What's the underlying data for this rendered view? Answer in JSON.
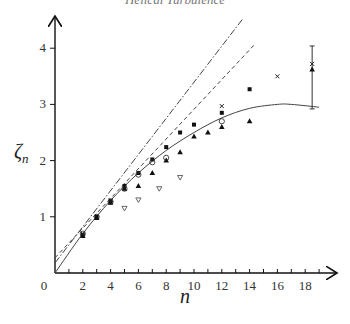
{
  "chart_data": {
    "type": "scatter",
    "title": "Helical Turbulence",
    "xlabel": "n",
    "ylabel": "ζ_n",
    "xlim": [
      0,
      19.5
    ],
    "ylim": [
      0,
      4.4
    ],
    "x_ticks": [
      2,
      4,
      6,
      8,
      10,
      12,
      14,
      16,
      18
    ],
    "y_ticks": [
      0,
      1,
      2,
      3,
      4
    ],
    "grid": false,
    "legend": null,
    "lines": [
      {
        "name": "dash-dot line (K41-like, slope ~0.4)",
        "style": "dash-dot",
        "x": [
          0,
          13.5
        ],
        "y": [
          0.18,
          4.52
        ]
      },
      {
        "name": "dashed line",
        "style": "dashed",
        "x": [
          0,
          14.3
        ],
        "y": [
          0.27,
          4.05
        ]
      },
      {
        "name": "solid model curve",
        "style": "solid",
        "x": [
          0,
          2,
          4,
          6,
          8,
          10,
          12,
          14,
          16,
          17,
          19
        ],
        "y": [
          0,
          0.7,
          1.29,
          1.78,
          2.18,
          2.5,
          2.76,
          2.93,
          3.0,
          3.0,
          2.95
        ]
      }
    ],
    "series": [
      {
        "name": "filled squares",
        "marker": "square-filled",
        "x": [
          2,
          3,
          4,
          5,
          6,
          7,
          8,
          9,
          10,
          12,
          14
        ],
        "y": [
          0.68,
          1.0,
          1.28,
          1.55,
          1.78,
          2.02,
          2.24,
          2.5,
          2.64,
          2.85,
          3.27
        ]
      },
      {
        "name": "open circles",
        "marker": "circle-open",
        "x": [
          2,
          3,
          4,
          5,
          6,
          7,
          8,
          12
        ],
        "y": [
          0.7,
          1.0,
          1.27,
          1.5,
          1.75,
          1.97,
          2.05,
          2.7
        ]
      },
      {
        "name": "filled triangles",
        "marker": "triangle-filled",
        "x": [
          2,
          3,
          4,
          5,
          6,
          7,
          8,
          9,
          10,
          11,
          12,
          14,
          18.5
        ],
        "y": [
          0.66,
          0.98,
          1.25,
          1.5,
          1.55,
          1.78,
          2.0,
          2.15,
          2.43,
          2.5,
          2.6,
          2.7,
          3.62
        ]
      },
      {
        "name": "crosses",
        "marker": "cross",
        "x": [
          2,
          4,
          12,
          16,
          18.5
        ],
        "y": [
          0.7,
          1.3,
          2.97,
          3.5,
          3.72
        ]
      },
      {
        "name": "open inverted triangles",
        "marker": "triangle-down-open",
        "x": [
          5,
          6,
          7.5,
          9
        ],
        "y": [
          1.15,
          1.3,
          1.5,
          1.7
        ]
      }
    ],
    "error_bars": [
      {
        "x": 18.5,
        "y_low": 2.92,
        "y_high": 4.04
      }
    ]
  }
}
